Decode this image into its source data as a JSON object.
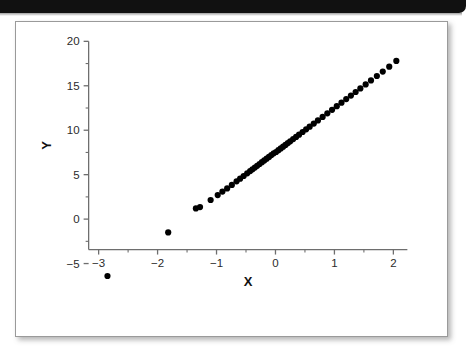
{
  "header": {
    "bar_color": "#111111"
  },
  "figure": {
    "background": "#ffffff",
    "border_color": "#9a9a9a"
  },
  "chart_data": {
    "type": "scatter",
    "title": "",
    "subtitle": "",
    "xlabel": "X",
    "ylabel": "Y",
    "xlim": [
      -3.35,
      2.35
    ],
    "ylim": [
      -8.2,
      20.6
    ],
    "xticks": [
      -3,
      -2,
      -1,
      0,
      1,
      2
    ],
    "xticklabels": [
      "−3",
      "−2",
      "−1",
      "0",
      "1",
      "2"
    ],
    "yticks": [
      -5,
      0,
      5,
      10,
      15,
      20
    ],
    "yticklabels": [
      "−5",
      "0",
      "5",
      "10",
      "15",
      "20"
    ],
    "minor_tick_step_x": 0.5,
    "minor_tick_step_y": 2.5,
    "grid": false,
    "legend": null,
    "marker": "circle",
    "marker_color": "#000000",
    "marker_size": 3.1,
    "annotations": [],
    "series": [
      {
        "name": "observations",
        "x": [
          -2.85,
          -1.82,
          -1.35,
          -1.28,
          -1.1,
          -0.98,
          -0.9,
          -0.82,
          -0.74,
          -0.66,
          -0.6,
          -0.54,
          -0.48,
          -0.43,
          -0.39,
          -0.35,
          -0.31,
          -0.27,
          -0.23,
          -0.19,
          -0.15,
          -0.11,
          -0.07,
          -0.03,
          0.01,
          0.05,
          0.09,
          0.13,
          0.17,
          0.21,
          0.25,
          0.3,
          0.35,
          0.4,
          0.46,
          0.52,
          0.58,
          0.65,
          0.72,
          0.8,
          0.88,
          0.96,
          1.04,
          1.12,
          1.2,
          1.28,
          1.36,
          1.44,
          1.53,
          1.62,
          1.72,
          1.82,
          1.93,
          2.05
        ],
        "y": [
          -6.4,
          -1.5,
          1.2,
          1.35,
          2.15,
          2.7,
          3.1,
          3.45,
          3.85,
          4.25,
          4.55,
          4.85,
          5.15,
          5.4,
          5.6,
          5.8,
          6.0,
          6.2,
          6.4,
          6.6,
          6.8,
          7.0,
          7.2,
          7.4,
          7.55,
          7.75,
          7.95,
          8.15,
          8.35,
          8.55,
          8.75,
          9.0,
          9.25,
          9.5,
          9.8,
          10.1,
          10.4,
          10.75,
          11.1,
          11.5,
          11.9,
          12.3,
          12.7,
          13.1,
          13.5,
          13.9,
          14.3,
          14.7,
          15.15,
          15.6,
          16.1,
          16.6,
          17.15,
          17.8
        ]
      }
    ]
  }
}
